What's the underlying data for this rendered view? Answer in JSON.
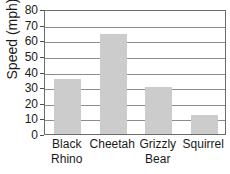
{
  "chart_data": {
    "type": "bar",
    "title": "of Mammals",
    "title_note": "clipped at top edge",
    "xlabel": "",
    "ylabel": "Speed (mph)",
    "categories": [
      "Black Rhino",
      "Cheetah",
      "Grizzly Bear",
      "Squirrel"
    ],
    "category_lines": [
      [
        "Black",
        "Rhino"
      ],
      [
        "Cheetah",
        ""
      ],
      [
        "Grizzly",
        "Bear"
      ],
      [
        "Squirrel",
        ""
      ]
    ],
    "values": [
      35,
      64,
      30,
      12
    ],
    "ylim": [
      0,
      80
    ],
    "ytick_labels": [
      "80",
      "70",
      "60",
      "50",
      "40",
      "30",
      "20",
      "10",
      "0"
    ],
    "ytick_values": [
      80,
      70,
      60,
      50,
      40,
      30,
      20,
      10,
      0
    ],
    "ytick_step": 10,
    "grid": "horizontal",
    "legend": "none",
    "bar_color": "#cccccc",
    "axis_color": "#6b6b6b",
    "grid_color": "#8c8c8c",
    "text_color": "#1a1a1a"
  }
}
